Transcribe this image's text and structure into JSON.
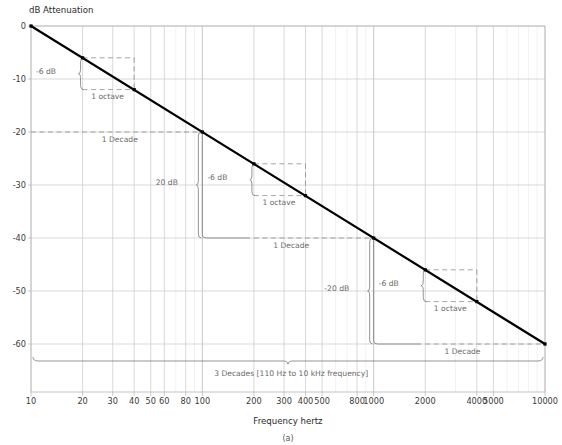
{
  "figure": {
    "caption": "(a)",
    "y_axis_title": "dB Attenuation",
    "x_axis_title": "Frequency hertz"
  },
  "chart_data": {
    "type": "line",
    "title": "",
    "subtitle": "",
    "xlabel": "Frequency hertz",
    "ylabel": "dB Attenuation",
    "xscale": "log",
    "yscale": "linear",
    "xlim": [
      10,
      10000
    ],
    "ylim": [
      -65,
      0
    ],
    "grid": true,
    "legend": null,
    "xticks": [
      10,
      20,
      30,
      40,
      50,
      60,
      80,
      100,
      200,
      300,
      400,
      500,
      800,
      1000,
      2000,
      4000,
      5000,
      10000
    ],
    "xtick_labels": [
      "10",
      "20",
      "30",
      "40",
      "50",
      "60",
      "80",
      "100",
      "200",
      "300",
      "400",
      "500",
      "800",
      "1000",
      "2000",
      "4000",
      "5000",
      "10000"
    ],
    "yticks": [
      0,
      -10,
      -20,
      -30,
      -40,
      -50,
      -60
    ],
    "ytick_labels": [
      "0",
      "-10",
      "-20",
      "-30",
      "-40",
      "-50",
      "-60"
    ],
    "series": [
      {
        "name": "20 dB per decade roll-off",
        "color": "#000000",
        "x": [
          10,
          10000
        ],
        "y": [
          0,
          -60
        ],
        "slope_db_per_decade": -20,
        "slope_db_per_octave": -6,
        "markers": [
          {
            "x": 10,
            "y": 0
          },
          {
            "x": 20,
            "y": -6
          },
          {
            "x": 40,
            "y": -12
          },
          {
            "x": 100,
            "y": -20
          },
          {
            "x": 200,
            "y": -26
          },
          {
            "x": 400,
            "y": -32
          },
          {
            "x": 1000,
            "y": -40
          },
          {
            "x": 2000,
            "y": -46
          },
          {
            "x": 4000,
            "y": -52
          },
          {
            "x": 10000,
            "y": -60
          }
        ]
      }
    ],
    "annotations": [
      {
        "id": "oct1-db",
        "label": "-6 dB",
        "x": 14,
        "y": -9
      },
      {
        "id": "oct1-span",
        "label": "1 octave",
        "x": 28,
        "y": -13.8
      },
      {
        "id": "dec1-span",
        "label": "1 Decade",
        "x": 33,
        "y": -21.8
      },
      {
        "id": "dec1-db",
        "label": "20 dB",
        "x": 72,
        "y": -30
      },
      {
        "id": "oct2-db",
        "label": "-6 dB",
        "x": 140,
        "y": -29
      },
      {
        "id": "oct2-span",
        "label": "1 octave",
        "x": 280,
        "y": -33.8
      },
      {
        "id": "dec2-span",
        "label": "1 Decade",
        "x": 330,
        "y": -41.8
      },
      {
        "id": "dec2-db",
        "label": "-20 dB",
        "x": 720,
        "y": -50
      },
      {
        "id": "oct3-db",
        "label": "-6 dB",
        "x": 1400,
        "y": -49
      },
      {
        "id": "oct3-span",
        "label": "1 octave",
        "x": 2800,
        "y": -53.8
      },
      {
        "id": "dec3-span",
        "label": "1 Decade",
        "x": 3300,
        "y": -61.8
      },
      {
        "id": "decades3",
        "label": "3 Decades [110 Hz to 10 kHz frequency]",
        "x": 330,
        "y": -66
      }
    ]
  },
  "colors": {
    "curve": "#000000",
    "grid_minor": "#e2e2e2",
    "grid_major": "#c9c9c9",
    "frame": "#b5b5b5",
    "annotation": "#7a7a7a",
    "dashed": "#8e8e8e",
    "text": "#3a3a3a"
  }
}
